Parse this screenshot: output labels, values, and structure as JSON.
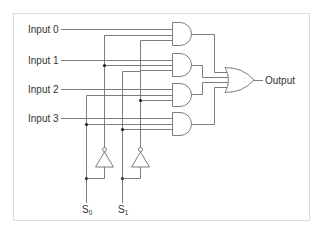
{
  "diagram": {
    "inputs": [
      {
        "label": "Input 0"
      },
      {
        "label": "Input 1"
      },
      {
        "label": "Input 2"
      },
      {
        "label": "Input 3"
      }
    ],
    "output": {
      "label": "Output"
    },
    "selects": [
      {
        "label": "S",
        "subscript": "0"
      },
      {
        "label": "S",
        "subscript": "1"
      }
    ],
    "gates": {
      "and": 4,
      "or": 1,
      "not": 2
    },
    "colors": {
      "wire": "#6e6e6e",
      "junction": "#222222",
      "frame": "#dcdcdc",
      "text": "#333333"
    }
  }
}
